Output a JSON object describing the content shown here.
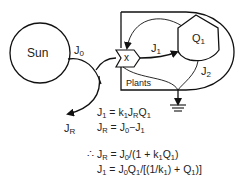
{
  "diagram": {
    "nodes": {
      "sun": {
        "label": "Sun"
      },
      "interaction": {
        "label": "x"
      },
      "storage": {
        "label": "Q",
        "sub": "1"
      },
      "plants_box": {
        "label": "Plants"
      }
    },
    "flows": {
      "j0": {
        "label": "J",
        "sub": "0"
      },
      "j1": {
        "label": "J",
        "sub": "1"
      },
      "j2": {
        "label": "J",
        "sub": "2"
      },
      "jr": {
        "label": "J",
        "sub": "R"
      }
    },
    "equations": [
      "J1 = k1 JR Q1",
      "JR = J0 − J1",
      "∴ JR = J0/(1 + k1 Q1)",
      "J1 = J0 Q1/[(1/k1) + Q1)]"
    ]
  }
}
